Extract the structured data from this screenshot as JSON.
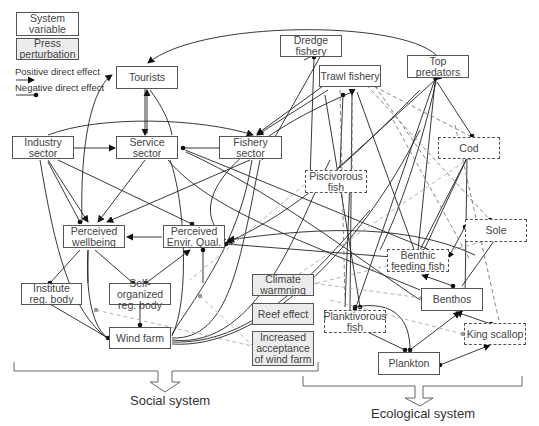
{
  "legend": {
    "system_variable": "System\nvariable",
    "press_perturbation": "Press\nperturbation",
    "positive_effect": "Positive direct effect",
    "negative_effect": "Negative direct effect"
  },
  "nodes": {
    "tourists": "Tourists",
    "industry_sector": "Industry sector",
    "service_sector": "Service sector",
    "fishery_sector": "Fishery sector",
    "perceived_wellbeing": "Perceived\nwellbeing",
    "perceived_envir_qual": "Perceived\nEnvir. Qual.",
    "institute_reg_body": "Institute\nreg. body",
    "self_organized_reg_body": "Self-organized\nreg. body",
    "wind_farm": "Wind farm",
    "climate_warming": "Climate\nwarmning",
    "reef_effect": "Reef effect",
    "increased_acceptance": "Increased\nacceptance\nof wind farm",
    "dredge_fishery": "Dredge fishery",
    "trawl_fishery": "Trawl fishery",
    "top_predators": "Top predators",
    "cod": "Cod",
    "piscivorous_fish": "Piscivorous\nfish",
    "sole": "Sole",
    "benthic_feeding_fish": "Benthic\nfeeding fish",
    "benthos": "Benthos",
    "planktivorous_fish": "Planktivorous\nfish",
    "king_scallop": "King scallop",
    "plankton": "Plankton"
  },
  "groups": {
    "social": "Social system",
    "ecological": "Ecological system"
  }
}
